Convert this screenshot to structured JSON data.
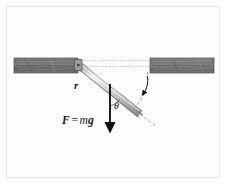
{
  "figure": {
    "domain": "Diagram",
    "background_color": "#ffffff",
    "frame_color": "#e6e6e6",
    "labels": {
      "radius": "r",
      "angle": "θ",
      "force_vector": "F",
      "force_equals": "=",
      "force_mass": "m",
      "force_gravity": "g",
      "force_full": "F = mg"
    },
    "elements": {
      "beam_left_name": "wooden-beam-left",
      "beam_right_name": "wooden-beam-right",
      "rod_name": "hinged-rod",
      "pivot_name": "pivot-hinge",
      "force_arrow_name": "gravity-force-arrow",
      "rotation_arrow_name": "rotation-direction-arrow",
      "angle_arc_name": "angle-arc",
      "reference_line_name": "horizontal-reference-line"
    },
    "colors": {
      "wood_dark": "#4f4f4f",
      "wood_mid": "#6e6e6e",
      "wood_light": "#9a9a9a",
      "rod_body": "#c9c9c9",
      "rod_edge": "#8a8a8a",
      "ink": "#1a1a1a",
      "dotted": "#9e9e9e",
      "dashed": "#8c8c8c"
    },
    "geometry": {
      "beam_top_y": 58,
      "beam_bottom_y": 73,
      "beam_left_x1": 14,
      "beam_left_x2": 78,
      "beam_right_x1": 150,
      "beam_right_x2": 214,
      "pivot_x": 78,
      "pivot_y": 64,
      "rod_end_x": 139,
      "rod_end_y": 114,
      "force_arrow_x": 110,
      "force_arrow_y_start": 84,
      "force_arrow_y_end": 129,
      "angle_degrees": 38
    }
  }
}
